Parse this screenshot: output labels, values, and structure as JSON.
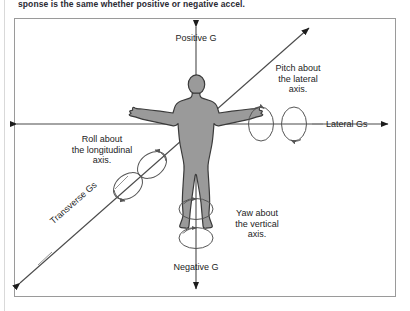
{
  "caption": {
    "text": "sponse is the same whether positive or negative accel."
  },
  "figure": {
    "border_color": "#9a9a9a",
    "body_fill": "#9a9a9a",
    "body_stroke": "#333333",
    "line_color": "#4a4a4a",
    "axes": [
      {
        "name": "vertical-axis",
        "positive_label": "Positive G",
        "negative_label": "Negative G",
        "rotation_label": "Yaw about\nthe vertical\naxis."
      },
      {
        "name": "lateral-axis",
        "label": "Lateral Gs",
        "rotation_label": "Pitch about\nthe lateral\naxis."
      },
      {
        "name": "transverse-axis",
        "label": "Transverse Gs",
        "rotation_label": "Roll about\nthe longitudinal\naxis."
      }
    ],
    "labels": {
      "positive_g": "Positive G",
      "negative_g": "Negative G",
      "lateral_gs": "Lateral Gs",
      "transverse_gs": "Transverse Gs",
      "pitch_line1": "Pitch about",
      "pitch_line2": "the lateral",
      "pitch_line3": "axis.",
      "roll_line1": "Roll about",
      "roll_line2": "the longitudinal",
      "roll_line3": "axis.",
      "yaw_line1": "Yaw about",
      "yaw_line2": "the vertical",
      "yaw_line3": "axis."
    }
  }
}
